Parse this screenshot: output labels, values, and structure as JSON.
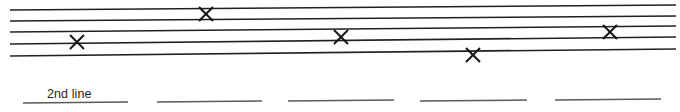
{
  "canvas": {
    "width": 680,
    "height": 112,
    "background_color": "#ffffff",
    "ink_color": "#231f20",
    "baseline_color": "#5a5a5a"
  },
  "ruled_lines": [
    {
      "id": "line-1",
      "x1": 10,
      "y1": 10,
      "x2": 676,
      "y2": 5
    },
    {
      "id": "line-2",
      "x1": 10,
      "y1": 21,
      "x2": 676,
      "y2": 16
    },
    {
      "id": "line-3",
      "x1": 10,
      "y1": 32,
      "x2": 676,
      "y2": 26
    },
    {
      "id": "line-4",
      "x1": 10,
      "y1": 44,
      "x2": 676,
      "y2": 37
    },
    {
      "id": "line-5",
      "x1": 10,
      "y1": 56,
      "x2": 676,
      "y2": 49
    }
  ],
  "x_markers": [
    {
      "id": "x-marker-1",
      "cx": 206,
      "cy": 14,
      "size": 7
    },
    {
      "id": "x-marker-2",
      "cx": 77,
      "cy": 42,
      "size": 7
    },
    {
      "id": "x-marker-3",
      "cx": 341,
      "cy": 37,
      "size": 7
    },
    {
      "id": "x-marker-4",
      "cx": 473,
      "cy": 55,
      "size": 7
    },
    {
      "id": "x-marker-5",
      "cx": 610,
      "cy": 32,
      "size": 7
    }
  ],
  "baseline_segments": [
    {
      "id": "baseline-seg-1",
      "x1": 23,
      "y1": 103,
      "x2": 128,
      "y2": 102
    },
    {
      "id": "baseline-seg-2",
      "x1": 157,
      "y1": 102,
      "x2": 262,
      "y2": 101
    },
    {
      "id": "baseline-seg-3",
      "x1": 288,
      "y1": 101,
      "x2": 394,
      "y2": 100
    },
    {
      "id": "baseline-seg-4",
      "x1": 420,
      "y1": 101,
      "x2": 527,
      "y2": 100
    },
    {
      "id": "baseline-seg-5",
      "x1": 555,
      "y1": 100,
      "x2": 661,
      "y2": 99
    }
  ],
  "labels": [
    {
      "id": "label-2nd-line",
      "text": "2nd line",
      "x": 47,
      "y": 88
    }
  ]
}
